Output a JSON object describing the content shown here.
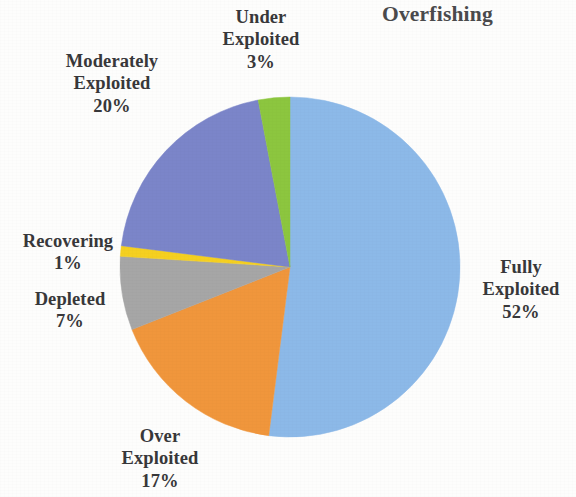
{
  "chart_data": {
    "type": "pie",
    "title": "Overfishing",
    "xlabel": "",
    "ylabel": "",
    "legend_position": "none",
    "grid": false,
    "labels_outside": true,
    "start_angle_deg": 0,
    "direction": "clockwise",
    "categories": [
      "Fully Exploited",
      "Over Exploited",
      "Depleted",
      "Recovering",
      "Moderately Exploited",
      "Under Exploited"
    ],
    "values": [
      52,
      17,
      7,
      1,
      20,
      3
    ],
    "value_unit": "%",
    "colors": [
      "#8CB9E8",
      "#F0963C",
      "#A6A6A6",
      "#F5D020",
      "#7B85C9",
      "#8CC63F"
    ],
    "slices": [
      {
        "label": "Fully Exploited",
        "value": 52,
        "display": "52%",
        "color": "#8CB9E8"
      },
      {
        "label": "Over Exploited",
        "value": 17,
        "display": "17%",
        "color": "#F0963C"
      },
      {
        "label": "Depleted",
        "value": 7,
        "display": "7%",
        "color": "#A6A6A6"
      },
      {
        "label": "Recovering",
        "value": 1,
        "display": "1%",
        "color": "#F5D020"
      },
      {
        "label": "Moderately Exploited",
        "value": 20,
        "display": "20%",
        "color": "#7B85C9"
      },
      {
        "label": "Under Exploited",
        "value": 3,
        "display": "3%",
        "color": "#8CC63F"
      }
    ]
  },
  "title": "Overfishing",
  "labels": {
    "under_exploited": {
      "line1": "Under",
      "line2": "Exploited",
      "pct": "3%"
    },
    "moderately_exploited": {
      "line1": "Moderately",
      "line2": "Exploited",
      "pct": "20%"
    },
    "recovering": {
      "line1": "Recovering",
      "pct": "1%"
    },
    "depleted": {
      "line1": "Depleted",
      "pct": "7%"
    },
    "fully_exploited": {
      "line1": "Fully",
      "line2": "Exploited",
      "pct": "52%"
    },
    "over_exploited": {
      "line1": "Over",
      "line2": "Exploited",
      "pct": "17%"
    }
  },
  "colors": {
    "background": "#fdfdfc",
    "title_text": "#4a4a4c",
    "label_text": "#38383a",
    "fully_exploited": "#8CB9E8",
    "over_exploited": "#F0963C",
    "depleted": "#A6A6A6",
    "recovering": "#F5D020",
    "moderately_exploited": "#7B85C9",
    "under_exploited": "#8CC63F"
  }
}
